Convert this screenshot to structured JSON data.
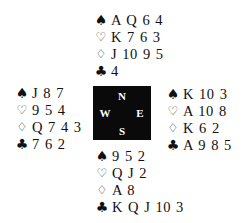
{
  "diagram": {
    "type": "bridge-deal",
    "compass": {
      "north": "N",
      "south": "S",
      "east": "E",
      "west": "W",
      "background": "#0a0a0a",
      "text_color": "#ffffff"
    },
    "suit_symbols": {
      "spades": "♠",
      "hearts": "♡",
      "diamonds": "♢",
      "clubs": "♣"
    },
    "hands": {
      "north": {
        "spades": "A Q 6 4",
        "hearts": "K 7 6 3",
        "diamonds": "J 10 9 5",
        "clubs": "4"
      },
      "west": {
        "spades": "J 8 7",
        "hearts": "9 5 4",
        "diamonds": "Q 7 4 3",
        "clubs": "7 6 2"
      },
      "east": {
        "spades": "K 10 3",
        "hearts": "A 10 8",
        "diamonds": "K 6 2",
        "clubs": "A 9 8 5"
      },
      "south": {
        "spades": "9 5 2",
        "hearts": "Q J 2",
        "diamonds": "A 8",
        "clubs": "K Q J 10 3"
      }
    }
  }
}
